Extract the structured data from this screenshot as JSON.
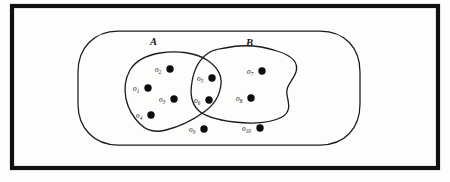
{
  "figure": {
    "frame": {
      "x": 12,
      "y": 6,
      "width": 426,
      "height": 162,
      "stroke_color": "#111111"
    },
    "universe": {
      "name": "universal-set",
      "label": "",
      "x": 78,
      "y": 31,
      "width": 282,
      "height": 114,
      "corner_radius": 40
    },
    "background_color": "#fdfdfb",
    "ink_color": "#141414"
  },
  "sets": [
    {
      "id": "A",
      "label": "A",
      "label_x": 150,
      "label_y": 45,
      "members": [
        "o1",
        "o2",
        "o3",
        "o4",
        "o5",
        "o6"
      ]
    },
    {
      "id": "B",
      "label": "B",
      "label_x": 246,
      "label_y": 46,
      "members": [
        "o5",
        "o6",
        "o7",
        "o8"
      ]
    }
  ],
  "intersection": {
    "label": "",
    "members": [
      "o5",
      "o6"
    ]
  },
  "outside_sets": {
    "members": [
      "o9",
      "o10"
    ]
  },
  "points": [
    {
      "id": "o1",
      "base": "o",
      "subscript": "1",
      "dot_x": 148,
      "dot_y": 88,
      "label_x": 133,
      "label_y": 91,
      "region": "A-only"
    },
    {
      "id": "o2",
      "base": "o",
      "subscript": "2",
      "dot_x": 170,
      "dot_y": 69,
      "label_x": 155,
      "label_y": 72,
      "region": "A-only"
    },
    {
      "id": "o3",
      "base": "o",
      "subscript": "3",
      "dot_x": 174,
      "dot_y": 99,
      "label_x": 159,
      "label_y": 102,
      "region": "A-only"
    },
    {
      "id": "o4",
      "base": "o",
      "subscript": "4",
      "dot_x": 151,
      "dot_y": 115,
      "label_x": 136,
      "label_y": 118,
      "region": "A-only"
    },
    {
      "id": "o5",
      "base": "o",
      "subscript": "5",
      "dot_x": 212,
      "dot_y": 78,
      "label_x": 197,
      "label_y": 81,
      "region": "A-and-B"
    },
    {
      "id": "o6",
      "base": "o",
      "subscript": "6",
      "dot_x": 209,
      "dot_y": 100,
      "label_x": 194,
      "label_y": 103,
      "region": "A-and-B"
    },
    {
      "id": "o7",
      "base": "o",
      "subscript": "7",
      "dot_x": 262,
      "dot_y": 71,
      "label_x": 247,
      "label_y": 74,
      "region": "B-only"
    },
    {
      "id": "o8",
      "base": "o",
      "subscript": "8",
      "dot_x": 251,
      "dot_y": 98,
      "label_x": 236,
      "label_y": 101,
      "region": "B-only"
    },
    {
      "id": "o9",
      "base": "o",
      "subscript": "9",
      "dot_x": 204,
      "dot_y": 129,
      "label_x": 189,
      "label_y": 132,
      "region": "outside"
    },
    {
      "id": "o10",
      "base": "o",
      "subscript": "10",
      "dot_x": 260,
      "dot_y": 128,
      "label_x": 242,
      "label_y": 131,
      "region": "outside"
    }
  ]
}
